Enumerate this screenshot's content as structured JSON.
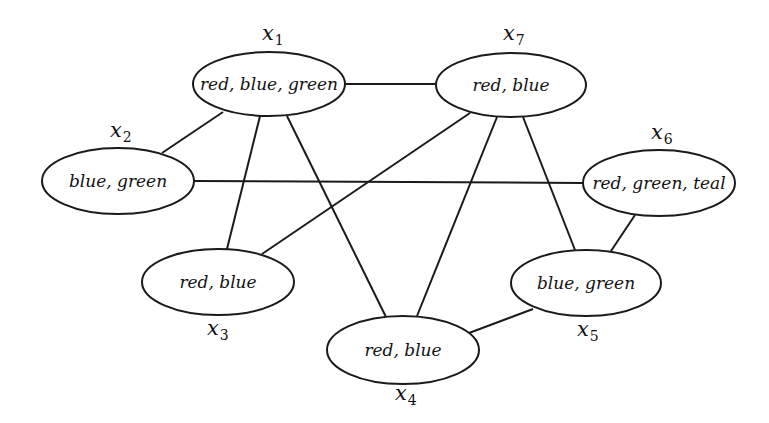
{
  "diagram": {
    "type": "constraint-graph",
    "nodes": [
      {
        "id": "x1",
        "var": "x",
        "sub": "1",
        "domain": "red, blue, green",
        "cx": 269,
        "cy": 84,
        "rx": 76,
        "ry": 32,
        "lx": 262,
        "ly": 40
      },
      {
        "id": "x2",
        "var": "x",
        "sub": "2",
        "domain": "blue, green",
        "cx": 118,
        "cy": 181,
        "rx": 76,
        "ry": 33,
        "lx": 110,
        "ly": 137
      },
      {
        "id": "x3",
        "var": "x",
        "sub": "3",
        "domain": "red, blue",
        "cx": 218,
        "cy": 282,
        "rx": 76,
        "ry": 33,
        "lx": 207,
        "ly": 335
      },
      {
        "id": "x4",
        "var": "x",
        "sub": "4",
        "domain": "red, blue",
        "cx": 403,
        "cy": 350,
        "rx": 76,
        "ry": 34,
        "lx": 395,
        "ly": 400
      },
      {
        "id": "x5",
        "var": "x",
        "sub": "5",
        "domain": "blue, green",
        "cx": 586,
        "cy": 283,
        "rx": 75,
        "ry": 33,
        "lx": 577,
        "ly": 336
      },
      {
        "id": "x6",
        "var": "x",
        "sub": "6",
        "domain": "red, green, teal",
        "cx": 659,
        "cy": 183,
        "rx": 76,
        "ry": 33,
        "lx": 651,
        "ly": 139
      },
      {
        "id": "x7",
        "var": "x",
        "sub": "7",
        "domain": "red, blue",
        "cx": 511,
        "cy": 85,
        "rx": 75,
        "ry": 32,
        "lx": 503,
        "ly": 40
      }
    ],
    "edges": [
      {
        "from": "x1",
        "to": "x7",
        "x1": 345,
        "y1": 84,
        "x2": 436,
        "y2": 84
      },
      {
        "from": "x1",
        "to": "x2",
        "x1": 223,
        "y1": 112,
        "x2": 162,
        "y2": 153
      },
      {
        "from": "x1",
        "to": "x3",
        "x1": 260,
        "y1": 116,
        "x2": 227,
        "y2": 249
      },
      {
        "from": "x1",
        "to": "x4",
        "x1": 287,
        "y1": 116,
        "x2": 386,
        "y2": 317
      },
      {
        "from": "x7",
        "to": "x3",
        "x1": 470,
        "y1": 113,
        "x2": 262,
        "y2": 254
      },
      {
        "from": "x7",
        "to": "x4",
        "x1": 497,
        "y1": 117,
        "x2": 417,
        "y2": 316
      },
      {
        "from": "x7",
        "to": "x5",
        "x1": 523,
        "y1": 117,
        "x2": 575,
        "y2": 250
      },
      {
        "from": "x2",
        "to": "x6",
        "x1": 194,
        "y1": 181,
        "x2": 583,
        "y2": 183
      },
      {
        "from": "x6",
        "to": "x5",
        "x1": 635,
        "y1": 215,
        "x2": 611,
        "y2": 251
      },
      {
        "from": "x4",
        "to": "x5",
        "x1": 469,
        "y1": 333,
        "x2": 533,
        "y2": 309
      }
    ],
    "colors": {
      "stroke": "#1a1a1a",
      "fill": "#ffffff",
      "text": "#111111"
    }
  }
}
